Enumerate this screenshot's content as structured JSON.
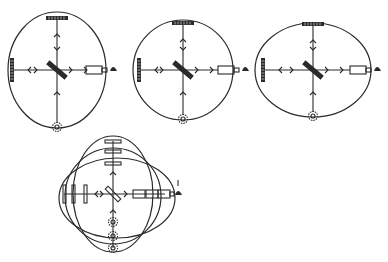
{
  "figure": {
    "type": "hand-drawn interferometer sketches",
    "panels": [
      {
        "id": "panel-1",
        "shape": "oval-tall"
      },
      {
        "id": "panel-2",
        "shape": "circle"
      },
      {
        "id": "panel-3",
        "shape": "oval-wide"
      },
      {
        "id": "panel-4",
        "shape": "overlay-of-three"
      }
    ],
    "colors": {
      "ink": "#2a2a2a",
      "background": "#ffffff"
    },
    "icons": [
      "mirror",
      "beam-splitter",
      "light-source",
      "detector-eye",
      "telescope",
      "arrow"
    ]
  }
}
